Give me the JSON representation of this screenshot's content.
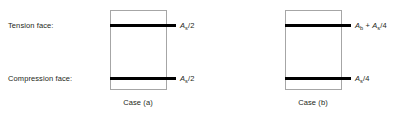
{
  "figure": {
    "background_color": "#ffffff",
    "text_color": "#231f20",
    "outline_color": "#a6a6a6",
    "rebar_color": "#000000"
  },
  "face_labels": {
    "tension": "Tension face:",
    "compression": "Compression face:"
  },
  "cases": [
    {
      "id": "a",
      "caption": "Case (a)",
      "top_area": {
        "prefix": "",
        "symbol": "A",
        "subscript": "s",
        "suffix": "/2",
        "full": "As/2"
      },
      "bottom_area": {
        "prefix": "",
        "symbol": "A",
        "subscript": "s",
        "suffix": "/2",
        "full": "As/2"
      }
    },
    {
      "id": "b",
      "caption": "Case (b)",
      "top_area": {
        "prefix": "",
        "symbol": "A",
        "subscript": "b",
        "suffix": " + ",
        "symbol2": "A",
        "subscript2": "s",
        "suffix2": "/4",
        "full": "Ab + As/4"
      },
      "bottom_area": {
        "prefix": "",
        "symbol": "A",
        "subscript": "s",
        "suffix": "/4",
        "full": "As/4"
      }
    }
  ]
}
